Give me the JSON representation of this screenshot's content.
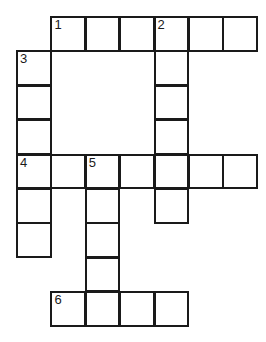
{
  "puzzle": {
    "type": "crossword",
    "grid_origin": [
      17,
      17
    ],
    "cell_size": 34.4,
    "entries": [
      {
        "number": "1",
        "direction": "across",
        "row": 0,
        "col": 1,
        "length": 6
      },
      {
        "number": "2",
        "direction": "down",
        "row": 0,
        "col": 4,
        "length": 6
      },
      {
        "number": "3",
        "direction": "down",
        "row": 1,
        "col": 0,
        "length": 6
      },
      {
        "number": "4",
        "direction": "across",
        "row": 4,
        "col": 0,
        "length": 7
      },
      {
        "number": "5",
        "direction": "down",
        "row": 4,
        "col": 2,
        "length": 5
      },
      {
        "number": "6",
        "direction": "across",
        "row": 8,
        "col": 1,
        "length": 4
      }
    ],
    "line_color": "#1a1a1a",
    "background": "#ffffff"
  }
}
